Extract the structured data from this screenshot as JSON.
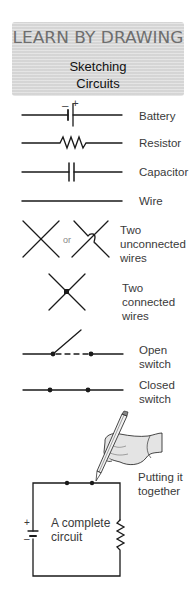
{
  "header": {
    "title": "LEARN BY DRAWING",
    "subtitle_line1": "Sketching",
    "subtitle_line2": "Circuits"
  },
  "symbols": [
    {
      "id": "battery",
      "label": "Battery",
      "marks": {
        "minus": "–",
        "plus": "+"
      }
    },
    {
      "id": "resistor",
      "label": "Resistor"
    },
    {
      "id": "capacitor",
      "label": "Capacitor"
    },
    {
      "id": "wire",
      "label": "Wire"
    },
    {
      "id": "unconnected",
      "label_lines": [
        "Two",
        "unconnected",
        "wires"
      ],
      "or_text": "or"
    },
    {
      "id": "connected",
      "label_lines": [
        "Two",
        "connected",
        "wires"
      ]
    },
    {
      "id": "open-switch",
      "label_lines": [
        "Open",
        "switch"
      ]
    },
    {
      "id": "closed-switch",
      "label_lines": [
        "Closed",
        "switch"
      ]
    }
  ],
  "together": {
    "label_lines": [
      "Putting it",
      "together"
    ],
    "circuit_text_lines": [
      "A complete",
      "circuit"
    ],
    "battery_marks": {
      "plus": "+",
      "minus": "–"
    }
  },
  "colors": {
    "line": "#1a1a1a",
    "header_bg": "#dcdcdc",
    "header_title": "#6e6e6e",
    "hand_fill": "#e4e4e4"
  }
}
